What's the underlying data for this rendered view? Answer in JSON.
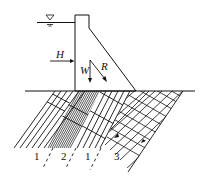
{
  "figure": {
    "type": "dam-foundation-cross-section",
    "colors": {
      "line": "#111111",
      "background": "#ffffff"
    },
    "water_level_symbol": "▽",
    "forces": [
      {
        "name": "H",
        "label": "H",
        "direction": "horizontal"
      },
      {
        "name": "W",
        "label": "W",
        "direction": "down"
      },
      {
        "name": "R",
        "label": "R",
        "direction": "down-right"
      }
    ],
    "strata_labels": [
      {
        "label": "1"
      },
      {
        "label": "2"
      },
      {
        "label": "1"
      },
      {
        "label": "3"
      }
    ]
  }
}
